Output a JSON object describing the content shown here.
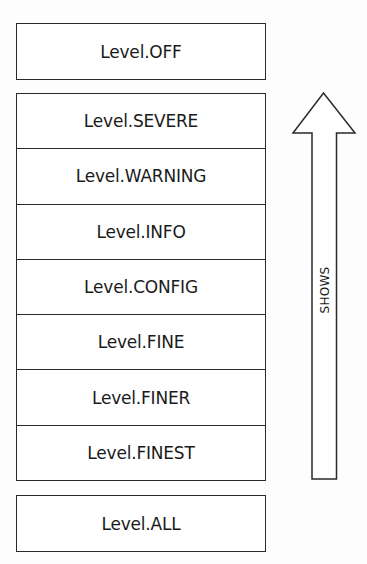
{
  "diagram": {
    "top_level": {
      "label": "Level.OFF"
    },
    "stack_levels": [
      {
        "label": "Level.SEVERE"
      },
      {
        "label": "Level.WARNING"
      },
      {
        "label": "Level.INFO"
      },
      {
        "label": "Level.CONFIG"
      },
      {
        "label": "Level.FINE"
      },
      {
        "label": "Level.FINER"
      },
      {
        "label": "Level.FINEST"
      }
    ],
    "bottom_level": {
      "label": "Level.ALL"
    },
    "arrow": {
      "label": "SHOWS",
      "direction": "up"
    }
  }
}
